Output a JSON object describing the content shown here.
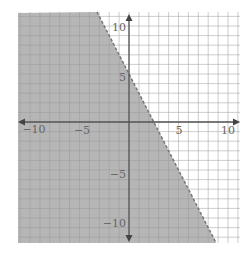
{
  "chart_data": {
    "type": "area",
    "title": "",
    "boundary_line": {
      "slope": -2,
      "intercept": 5,
      "style": "dashed"
    },
    "shaded_region": "below-left of line",
    "xlim": [
      -11,
      11
    ],
    "ylim": [
      -12,
      12
    ],
    "x_ticks": [
      -10,
      -5,
      5,
      10
    ],
    "y_ticks": [
      10,
      5,
      -5,
      -10
    ],
    "x_tick_labels": [
      "−10",
      "−5",
      "5",
      "10"
    ],
    "y_tick_labels": [
      "10",
      "5",
      "−5",
      "−10"
    ],
    "grid": true,
    "xlabel": "",
    "ylabel": "",
    "colors": {
      "shade": "#a9a9a9",
      "line": "#888888",
      "axis": "#555555",
      "grid": "#dddddd"
    }
  }
}
